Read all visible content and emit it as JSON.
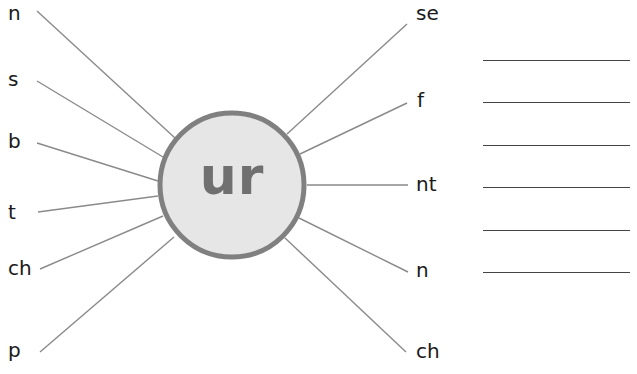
{
  "diagram": {
    "center": {
      "text": "ur",
      "fill": "#e6e6e6",
      "stroke": "#808080"
    },
    "left_letters": [
      "n",
      "s",
      "b",
      "t",
      "ch",
      "p"
    ],
    "right_letters": [
      "se",
      "f",
      "nt",
      "n",
      "ch"
    ],
    "answer_lines_count": 6,
    "line_color": "#888888"
  }
}
